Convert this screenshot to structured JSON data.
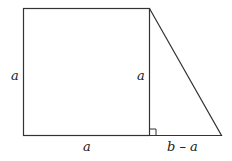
{
  "diagram": {
    "labels": {
      "left_side": "a",
      "inner_height": "a",
      "bottom_square": "a",
      "bottom_triangle": "b – a"
    },
    "colors": {
      "stroke": "#333333",
      "background": "#ffffff",
      "text": "#222222"
    }
  }
}
